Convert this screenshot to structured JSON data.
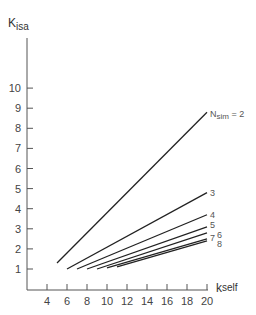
{
  "chart_data": {
    "type": "line",
    "title": "",
    "xlabel": "k_self",
    "ylabel": "K_isa",
    "xlabel_main": "k",
    "xlabel_sub": "self",
    "ylabel_main": "K",
    "ylabel_sub": "isa",
    "xlim": [
      2,
      20
    ],
    "ylim": [
      0,
      12
    ],
    "xticks": [
      4,
      6,
      8,
      10,
      12,
      14,
      16,
      18,
      20
    ],
    "yticks": [
      1,
      2,
      3,
      4,
      5,
      6,
      7,
      8,
      9,
      10
    ],
    "grid": false,
    "legend_position": "inline-right",
    "series": [
      {
        "name": "N_sim = 2",
        "label": "N",
        "label_sub": "sim",
        "label_suffix": " = 2",
        "x": [
          5,
          20
        ],
        "y": [
          1.3,
          8.8
        ]
      },
      {
        "name": "3",
        "label": "3",
        "x": [
          6,
          20
        ],
        "y": [
          1.0,
          4.8
        ]
      },
      {
        "name": "4",
        "label": "4",
        "x": [
          7,
          20
        ],
        "y": [
          1.0,
          3.7
        ]
      },
      {
        "name": "5",
        "label": "5",
        "x": [
          8,
          20
        ],
        "y": [
          1.0,
          3.1
        ]
      },
      {
        "name": "6",
        "label": "6",
        "x": [
          9,
          20
        ],
        "y": [
          1.0,
          2.8
        ]
      },
      {
        "name": "7",
        "label": "7",
        "x": [
          10,
          20
        ],
        "y": [
          1.05,
          2.5
        ]
      },
      {
        "name": "8",
        "label": "8",
        "x": [
          11,
          20
        ],
        "y": [
          1.1,
          2.4
        ]
      }
    ]
  }
}
